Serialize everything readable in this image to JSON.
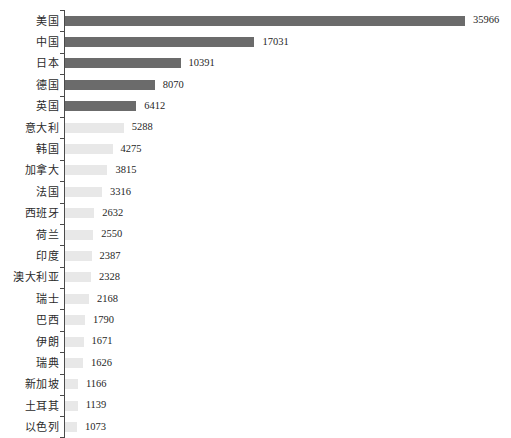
{
  "chart_data": {
    "type": "bar",
    "orientation": "horizontal",
    "title": "",
    "subtitle": "",
    "xlabel": "",
    "ylabel": "",
    "grid": false,
    "legend": "none",
    "xlim": [
      0,
      35966
    ],
    "axis": {
      "category_axis": "y",
      "value_axis": "x",
      "value_axis_visible": false,
      "category_spine_color": "#4a4a4a",
      "ticks_visible": true
    },
    "colors": {
      "bar_highlight": "#6b6b6b",
      "bar_default": "#e8e8e8",
      "label_text": "#2b2b2b",
      "value_text": "#1f1f1f",
      "background": "#ffffff"
    },
    "highlight_top_n": 5,
    "categories": [
      "美国",
      "中国",
      "日本",
      "德国",
      "英国",
      "意大利",
      "韩国",
      "加拿大",
      "法国",
      "西班牙",
      "荷兰",
      "印度",
      "澳大利亚",
      "瑞士",
      "巴西",
      "伊朗",
      "瑞典",
      "新加坡",
      "土耳其",
      "以色列"
    ],
    "values": [
      35966,
      17031,
      10391,
      8070,
      6412,
      5288,
      4275,
      3815,
      3316,
      2632,
      2550,
      2387,
      2328,
      2168,
      1790,
      1671,
      1626,
      1166,
      1139,
      1073
    ],
    "value_labels": [
      "35966",
      "17031",
      "10391",
      "8070",
      "6412",
      "5288",
      "4275",
      "3815",
      "3316",
      "2632",
      "2550",
      "2387",
      "2328",
      "2168",
      "1790",
      "1671",
      "1626",
      "1166",
      "1139",
      "1073"
    ],
    "bars": [
      {
        "category": "美国",
        "value": 35966,
        "label": "35966",
        "emphasis": "high"
      },
      {
        "category": "中国",
        "value": 17031,
        "label": "17031",
        "emphasis": "high"
      },
      {
        "category": "日本",
        "value": 10391,
        "label": "10391",
        "emphasis": "high"
      },
      {
        "category": "德国",
        "value": 8070,
        "label": "8070",
        "emphasis": "high"
      },
      {
        "category": "英国",
        "value": 6412,
        "label": "6412",
        "emphasis": "high"
      },
      {
        "category": "意大利",
        "value": 5288,
        "label": "5288",
        "emphasis": "low"
      },
      {
        "category": "韩国",
        "value": 4275,
        "label": "4275",
        "emphasis": "low"
      },
      {
        "category": "加拿大",
        "value": 3815,
        "label": "3815",
        "emphasis": "low"
      },
      {
        "category": "法国",
        "value": 3316,
        "label": "3316",
        "emphasis": "low"
      },
      {
        "category": "西班牙",
        "value": 2632,
        "label": "2632",
        "emphasis": "low"
      },
      {
        "category": "荷兰",
        "value": 2550,
        "label": "2550",
        "emphasis": "low"
      },
      {
        "category": "印度",
        "value": 2387,
        "label": "2387",
        "emphasis": "low"
      },
      {
        "category": "澳大利亚",
        "value": 2328,
        "label": "2328",
        "emphasis": "low"
      },
      {
        "category": "瑞士",
        "value": 2168,
        "label": "2168",
        "emphasis": "low"
      },
      {
        "category": "巴西",
        "value": 1790,
        "label": "1790",
        "emphasis": "low"
      },
      {
        "category": "伊朗",
        "value": 1671,
        "label": "1671",
        "emphasis": "low"
      },
      {
        "category": "瑞典",
        "value": 1626,
        "label": "1626",
        "emphasis": "low"
      },
      {
        "category": "新加坡",
        "value": 1166,
        "label": "1166",
        "emphasis": "low"
      },
      {
        "category": "土耳其",
        "value": 1139,
        "label": "1139",
        "emphasis": "low"
      },
      {
        "category": "以色列",
        "value": 1073,
        "label": "1073",
        "emphasis": "low"
      }
    ]
  }
}
